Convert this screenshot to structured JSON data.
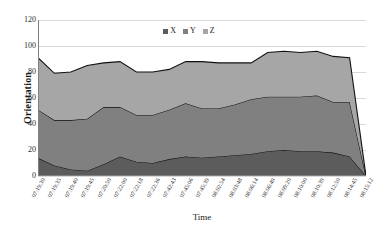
{
  "chart_data": {
    "type": "area",
    "stacked": true,
    "title": "",
    "xlabel": "Time",
    "ylabel": "Orientation",
    "ylim": [
      0,
      120
    ],
    "yticks": [
      0,
      20,
      40,
      60,
      80,
      100,
      120
    ],
    "grid": true,
    "legend_position": "top-center",
    "categories": [
      "07:19:30",
      "07:19:35",
      "07:19:40",
      "07:19:45",
      "07:20:50",
      "07:22:00",
      "07:22:18",
      "07:22:36",
      "07:42:43",
      "07:45:06",
      "07:45:39",
      "08:02:54",
      "08:03:48",
      "08:06:14",
      "08:06:49",
      "08:09:20",
      "08:10:00",
      "08:10:39",
      "08:12:50",
      "08:14:45",
      "08:15:12"
    ],
    "series": [
      {
        "name": "X",
        "color": "#5c5c5c",
        "values": [
          14,
          8,
          5,
          4,
          9,
          15,
          11,
          10,
          13,
          15,
          14,
          15,
          16,
          17,
          19,
          20,
          19,
          19,
          18,
          15,
          0
        ]
      },
      {
        "name": "Y",
        "color": "#808080",
        "values": [
          37,
          35,
          38,
          40,
          44,
          38,
          36,
          37,
          38,
          41,
          38,
          37,
          39,
          42,
          42,
          41,
          42,
          43,
          39,
          42,
          0
        ]
      },
      {
        "name": "Z",
        "color": "#a6a6a6",
        "values": [
          40,
          36,
          37,
          41,
          34,
          35,
          33,
          33,
          31,
          32,
          36,
          35,
          32,
          28,
          34,
          35,
          34,
          34,
          35,
          34,
          0
        ]
      }
    ],
    "cumulative_top": [
      91,
      79,
      80,
      85,
      87,
      88,
      80,
      80,
      82,
      88,
      88,
      87,
      87,
      87,
      95,
      96,
      95,
      96,
      92,
      91,
      0
    ],
    "cumulative_mid": [
      51,
      43,
      43,
      44,
      53,
      53,
      47,
      47,
      51,
      56,
      52,
      52,
      55,
      59,
      61,
      61,
      61,
      62,
      57,
      57,
      0
    ]
  },
  "legend": {
    "items": [
      {
        "label": "X"
      },
      {
        "label": "Y"
      },
      {
        "label": "Z"
      }
    ]
  },
  "colors": {
    "series_x": "#5c5c5c",
    "series_y": "#808080",
    "series_z": "#a6a6a6",
    "grid": "#d9d9d9",
    "axis": "#808080",
    "line": "#111111",
    "text": "#1a1a1a"
  }
}
